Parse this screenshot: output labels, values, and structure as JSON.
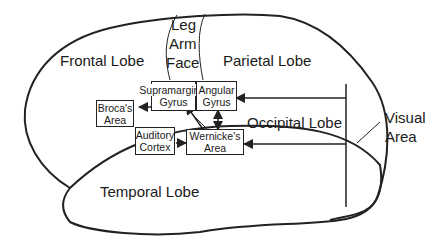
{
  "colors": {
    "line": "#222222",
    "text": "#1a1a1a",
    "background": "#ffffff"
  },
  "lobes": {
    "frontal": "Frontal Lobe",
    "parietal": "Parietal Lobe",
    "occipital": "Occipital Lobe",
    "temporal": "Temporal Lobe"
  },
  "motor_strip": {
    "leg": "Leg",
    "arm": "Arm",
    "face": "Face"
  },
  "visual_area": {
    "line1": "Visual",
    "line2": "Area"
  },
  "boxes": {
    "supramarginal": {
      "line1": "Supramarginal",
      "line2": "Gyrus"
    },
    "angular": {
      "line1": "Angular",
      "line2": "Gyrus"
    },
    "broca": {
      "line1": "Broca's",
      "line2": "Area"
    },
    "auditory": {
      "line1": "Auditory",
      "line2": "Cortex"
    },
    "wernicke": {
      "line1": "Wernicke's",
      "line2": "Area"
    }
  }
}
